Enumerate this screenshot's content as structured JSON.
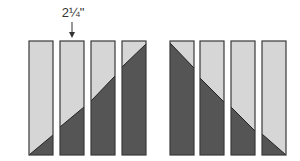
{
  "diagram": {
    "measurement_label": "2¼\"",
    "colors": {
      "light": "#d6d6d6",
      "dark": "#555555",
      "outline": "#3a3a3a",
      "background": "#ffffff"
    },
    "strip_top": 41,
    "strip_bottom": 155,
    "strip_width": 24,
    "left_group": [
      {
        "x": 29,
        "seam_left_y": 155,
        "seam_right_y": 135
      },
      {
        "x": 60,
        "seam_left_y": 127,
        "seam_right_y": 107
      },
      {
        "x": 91,
        "seam_left_y": 101,
        "seam_right_y": 76
      },
      {
        "x": 122,
        "seam_left_y": 67,
        "seam_right_y": 44
      }
    ],
    "right_group": [
      {
        "x": 170,
        "seam_left_y": 43,
        "seam_right_y": 68
      },
      {
        "x": 200,
        "seam_left_y": 78,
        "seam_right_y": 102
      },
      {
        "x": 231,
        "seam_left_y": 107,
        "seam_right_y": 131
      },
      {
        "x": 262,
        "seam_left_y": 134,
        "seam_right_y": 155
      }
    ]
  }
}
